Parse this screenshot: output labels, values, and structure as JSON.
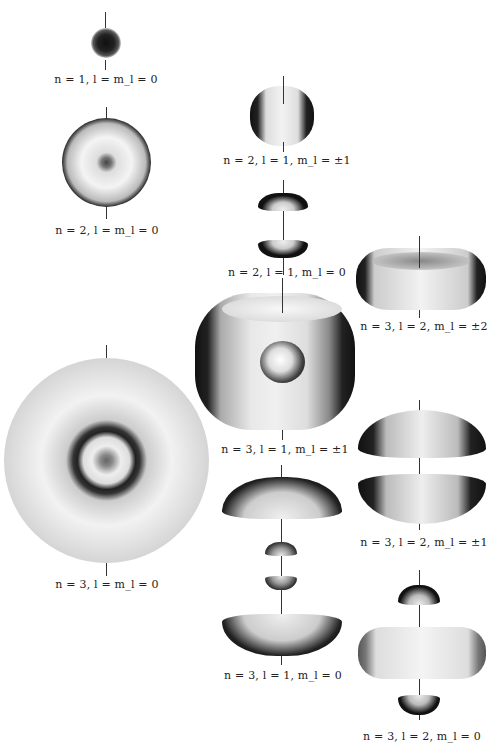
{
  "figure": {
    "orbitals": [
      {
        "id": "n1-l0-m0",
        "label": "n = 1, l = m_l = 0",
        "n": 1,
        "l": 0,
        "ml": "0"
      },
      {
        "id": "n2-l0-m0",
        "label": "n = 2, l = m_l = 0",
        "n": 2,
        "l": 0,
        "ml": "0"
      },
      {
        "id": "n2-l1-m1",
        "label": "n = 2, l = 1, m_l = ±1",
        "n": 2,
        "l": 1,
        "ml": "±1"
      },
      {
        "id": "n2-l1-m0",
        "label": "n = 2, l = 1, m_l = 0",
        "n": 2,
        "l": 1,
        "ml": "0"
      },
      {
        "id": "n3-l2-m2",
        "label": "n = 3, l = 2, m_l = ±2",
        "n": 3,
        "l": 2,
        "ml": "±2"
      },
      {
        "id": "n3-l1-m1",
        "label": "n = 3, l = 1, m_l = ±1",
        "n": 3,
        "l": 1,
        "ml": "±1"
      },
      {
        "id": "n3-l0-m0",
        "label": "n = 3, l = m_l = 0",
        "n": 3,
        "l": 0,
        "ml": "0"
      },
      {
        "id": "n3-l2-m1",
        "label": "n = 3, l = 2, m_l = ±1",
        "n": 3,
        "l": 2,
        "ml": "±1"
      },
      {
        "id": "n3-l1-m0",
        "label": "n = 3, l = 1, m_l = 0",
        "n": 3,
        "l": 1,
        "ml": "0"
      },
      {
        "id": "n3-l2-m0",
        "label": "n = 3, l = 2, m_l = 0",
        "n": 3,
        "l": 2,
        "ml": "0"
      }
    ]
  }
}
